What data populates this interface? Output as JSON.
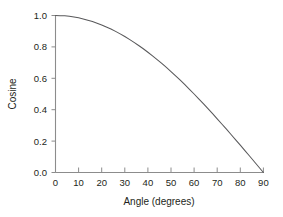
{
  "chart_data": {
    "type": "line",
    "title": "",
    "xlabel": "Angle (degrees)",
    "ylabel": "Cosine",
    "xlim": [
      0,
      90
    ],
    "ylim": [
      0.0,
      1.0
    ],
    "grid": false,
    "legend": null,
    "xticks": [
      0,
      10,
      20,
      30,
      40,
      50,
      60,
      70,
      80,
      90
    ],
    "xtick_labels": [
      "0",
      "10",
      "20",
      "30",
      "40",
      "50",
      "60",
      "70",
      "80",
      "90"
    ],
    "yticks": [
      0.0,
      0.2,
      0.4,
      0.6,
      0.8,
      1.0
    ],
    "ytick_labels": [
      "0.0",
      "0.2",
      "0.4",
      "0.6",
      "0.8",
      "1.0"
    ],
    "series": [
      {
        "name": "Cosine",
        "color": "#58585a",
        "x": [
          0,
          2,
          4,
          6,
          8,
          10,
          12,
          14,
          16,
          18,
          20,
          22,
          24,
          26,
          28,
          30,
          32,
          34,
          36,
          38,
          40,
          42,
          44,
          46,
          48,
          50,
          52,
          54,
          56,
          58,
          60,
          62,
          64,
          66,
          68,
          70,
          72,
          74,
          76,
          78,
          80,
          82,
          84,
          86,
          88,
          90
        ],
        "values": [
          1.0,
          0.999,
          0.998,
          0.995,
          0.99,
          0.985,
          0.978,
          0.97,
          0.961,
          0.951,
          0.94,
          0.927,
          0.914,
          0.899,
          0.883,
          0.866,
          0.848,
          0.829,
          0.809,
          0.788,
          0.766,
          0.743,
          0.719,
          0.695,
          0.669,
          0.643,
          0.616,
          0.588,
          0.559,
          0.53,
          0.5,
          0.469,
          0.438,
          0.407,
          0.375,
          0.342,
          0.309,
          0.276,
          0.242,
          0.208,
          0.174,
          0.139,
          0.105,
          0.07,
          0.035,
          0.0
        ]
      }
    ]
  },
  "colors": {
    "curve": "#58585a",
    "axis": "#8c8c8c",
    "text": "#231f20",
    "background": "#ffffff"
  }
}
